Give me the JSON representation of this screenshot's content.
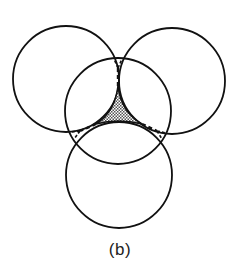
{
  "figure": {
    "caption": "(b)",
    "stroke_color": "#111111",
    "fill_pattern_color": "#555555",
    "circles": [
      {
        "name": "top-left",
        "cx": 66,
        "cy": 79,
        "r": 53
      },
      {
        "name": "top-right",
        "cx": 172,
        "cy": 81,
        "r": 53
      },
      {
        "name": "middle",
        "cx": 118,
        "cy": 111,
        "r": 53
      },
      {
        "name": "bottom",
        "cx": 119,
        "cy": 175,
        "r": 53
      }
    ],
    "shaded_region": "curved triangle at center of middle circle (hatched)"
  }
}
